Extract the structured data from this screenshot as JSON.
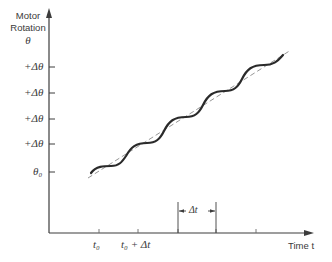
{
  "y_axis": {
    "title_line1": "Motor",
    "title_line2": "Rotation",
    "title_symbol": "θ",
    "ticks": [
      {
        "label": "+Δθ",
        "y": 67
      },
      {
        "label": "+Δθ",
        "y": 93
      },
      {
        "label": "+Δθ",
        "y": 119
      },
      {
        "label": "+Δθ",
        "y": 144
      },
      {
        "label": "θ₀",
        "y": 172
      }
    ]
  },
  "x_axis": {
    "title": "Time t",
    "ticks": [
      {
        "label": "t₀",
        "x": 99
      },
      {
        "label": "t₀ + Δt",
        "x": 138
      },
      {
        "label": "",
        "x": 178
      },
      {
        "label": "",
        "x": 216
      },
      {
        "label": "",
        "x": 256
      }
    ],
    "interval_label": "Δt"
  },
  "curves": {
    "actual": "stepped sinusoidal motor rotation (solid)",
    "average": "linear average rotation (dashed)"
  },
  "colors": {
    "axis": "#3c3c3c",
    "curve": "#2a2a2a",
    "dashed": "#8a8a8a"
  }
}
